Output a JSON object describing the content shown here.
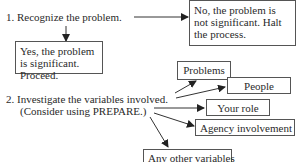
{
  "step1": {
    "label": "1. Recognize the problem.",
    "no_outcome": "No, the problem is not significant. Halt the process.",
    "yes_outcome": "Yes, the problem is significant. Proceed."
  },
  "step2": {
    "label_line1": "2. Investigate the variables involved.",
    "label_line2": "(Consider using PREPARE.)",
    "variables": [
      {
        "label": "Problems"
      },
      {
        "label": "People"
      },
      {
        "label": "Your role"
      },
      {
        "label": "Agency involvement"
      },
      {
        "label": "Any other variables"
      }
    ]
  },
  "colors": {
    "text": "#2a2a2a",
    "border": "#555555",
    "arrow": "#222222",
    "background": "#ffffff"
  }
}
